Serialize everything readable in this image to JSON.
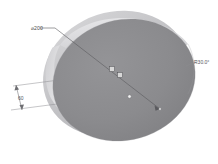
{
  "view": {
    "title": "Cylinder dimensioned isometric view",
    "background_color": "#ffffff",
    "render_style": "shaded-grayscale"
  },
  "model": {
    "shape_name": "cylinder",
    "front_face_color": "#8a8a8c",
    "back_face_color": "#c9c9cb",
    "side_surface_color": "#dcdcde",
    "rim_highlight_color": "#e8e8ea",
    "outline_color": "#9a9a9e"
  },
  "annotations": {
    "diameter": {
      "label": "⌀200",
      "symbol_name": "diameter-symbol",
      "value": "200",
      "leader_from": "upper-left",
      "terminator": "arrow"
    },
    "thickness": {
      "label": "60",
      "value": "60",
      "location": "left-side",
      "terminator": "arrow-both-ends"
    },
    "angle": {
      "label": "R30.0°",
      "value": "30.0",
      "unit": "°",
      "location": "right-edge"
    }
  },
  "markers": {
    "vertex_a": {
      "name": "vertex-marker-a"
    },
    "vertex_b": {
      "name": "vertex-marker-b"
    },
    "center_point": {
      "name": "center-point-dot"
    },
    "edge_point": {
      "name": "edge-endpoint-dot"
    }
  }
}
